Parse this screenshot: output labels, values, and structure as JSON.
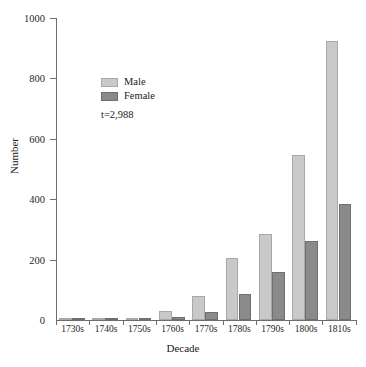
{
  "chart_data": {
    "type": "bar",
    "title": "",
    "xlabel": "Decade",
    "ylabel": "Number",
    "categories": [
      "1730s",
      "1740s",
      "1750s",
      "1760s",
      "1770s",
      "1780s",
      "1790s",
      "1800s",
      "1810s"
    ],
    "series": [
      {
        "name": "Male",
        "color": "#c9c9c9",
        "values": [
          8,
          8,
          3,
          30,
          78,
          205,
          285,
          545,
          925
        ]
      },
      {
        "name": "Female",
        "color": "#8a8a8a",
        "values": [
          3,
          5,
          2,
          10,
          25,
          85,
          160,
          262,
          385
        ]
      }
    ],
    "ylim": [
      0,
      1000
    ],
    "yticks": [
      0,
      200,
      400,
      600,
      800,
      1000
    ],
    "ytick_labels": [
      "0",
      "200",
      "400",
      "600",
      "800",
      "1000"
    ],
    "grid": false,
    "legend_position": "upper-left-inset",
    "annotation": "t=2,988"
  },
  "axes": {
    "y_title": "Number",
    "x_title": "Decade"
  },
  "legend": {
    "entries": [
      {
        "label": "Male"
      },
      {
        "label": "Female"
      }
    ],
    "annotation": "t=2,988"
  }
}
